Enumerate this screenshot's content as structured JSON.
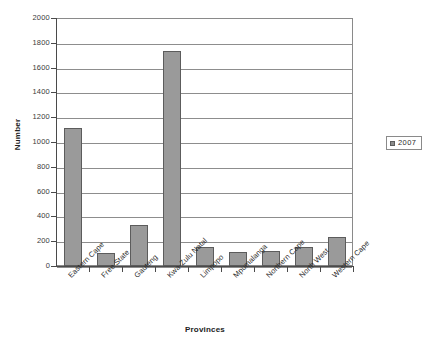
{
  "chart_data": {
    "type": "bar",
    "title": "",
    "xlabel": "Provinces",
    "ylabel": "Number",
    "ylim": [
      0,
      2000
    ],
    "ytick_step": 200,
    "yticks": [
      "2000",
      "1800",
      "1600",
      "1400",
      "1200",
      "1000",
      "800",
      "600",
      "400",
      "200",
      "0"
    ],
    "grid": true,
    "legend_position": "right",
    "categories": [
      "Eastern Cape",
      "Free State",
      "Gauteng",
      "Kwa-Zulu Natal",
      "Limpopo",
      "Mpumalanga",
      "Northern Cape",
      "North West",
      "Western Cape"
    ],
    "series": [
      {
        "name": "2007",
        "color": "#9a9a9a",
        "values": [
          1110,
          105,
          330,
          1730,
          155,
          110,
          125,
          150,
          230
        ]
      }
    ]
  },
  "legend": {
    "entries": [
      {
        "label": "2007",
        "swatch_color": "#8c8c8c"
      }
    ]
  },
  "colors": {
    "bar_fill": "#9a9a9a",
    "bar_stroke": "#5c5c5c",
    "gridline": "#8d8d8d",
    "axis": "#4a4a4a",
    "plot_border": "#8a8a8a",
    "background": "#ffffff",
    "text": "#2d2d2d"
  }
}
